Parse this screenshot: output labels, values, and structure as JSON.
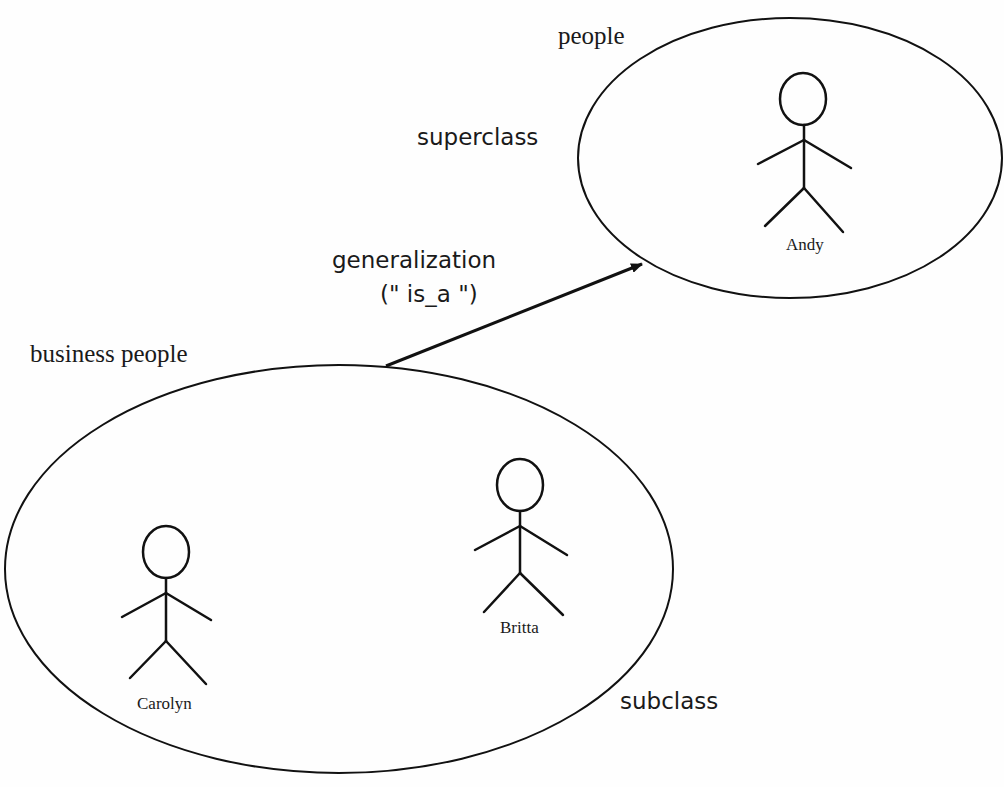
{
  "diagram": {
    "type": "generalization",
    "superclass_set": {
      "name": "people",
      "role_label": "superclass",
      "members": [
        "Andy"
      ]
    },
    "subclass_set": {
      "name": "business people",
      "role_label": "subclass",
      "members": [
        "Carolyn",
        "Britta"
      ]
    },
    "relationship": {
      "label": "generalization",
      "sublabel": "(\" is_a \")",
      "from": "business people",
      "to": "people"
    }
  },
  "colors": {
    "stroke": "#111111",
    "background": "#fefefe"
  }
}
